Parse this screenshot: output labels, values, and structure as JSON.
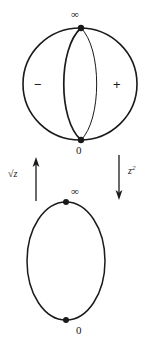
{
  "figure": {
    "stroke_color": "#1a1a1a",
    "background_color": "#ffffff",
    "top_diagram": {
      "name": "double-covered-sphere",
      "description": "Circle with two interior meridian arcs meeting at two marked branch points",
      "top_point_label": "∞",
      "bottom_point_label": "0",
      "left_region_label": "−",
      "right_region_label": "+",
      "circle": {
        "cx": 80,
        "cy": 84,
        "r": 57
      },
      "points": [
        {
          "name": "infinity-point",
          "x": 81,
          "y": 28
        },
        {
          "name": "zero-point",
          "x": 81,
          "y": 140
        }
      ],
      "meridians": [
        {
          "name": "left-meridian",
          "bulge": -22,
          "width": 1.7
        },
        {
          "name": "right-meridian",
          "bulge": 20,
          "width": 1.0
        }
      ]
    },
    "bottom_diagram": {
      "name": "base-sphere",
      "description": "Plain circle with two marked points",
      "top_point_label": "∞",
      "bottom_point_label": "0",
      "circle": {
        "cx": 66,
        "cy": 261,
        "r": 59
      },
      "points": [
        {
          "name": "infinity-point",
          "x": 66,
          "y": 202
        },
        {
          "name": "zero-point",
          "x": 66,
          "y": 320
        }
      ]
    },
    "arrows": [
      {
        "name": "sqrt-arrow",
        "label_text": "√z",
        "label_radical": "√",
        "label_variable": "z",
        "direction": "up",
        "x": 36,
        "y_top": 158,
        "y_bottom": 200
      },
      {
        "name": "square-arrow",
        "label_text": "z²",
        "label_variable": "z",
        "label_exponent": "2",
        "direction": "down",
        "x": 119,
        "y_top": 155,
        "y_bottom": 201
      }
    ]
  }
}
